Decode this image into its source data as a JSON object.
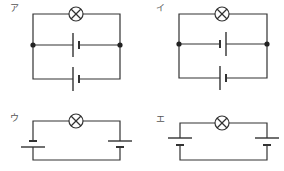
{
  "diagram": {
    "type": "circuit-choices",
    "colors": {
      "line": "#333333",
      "label": "#555555",
      "background": "#ffffff"
    },
    "circuits": [
      {
        "id": "a",
        "label": "ア",
        "description": "Lamp in series with two batteries connected in parallel; same orientation",
        "components": [
          "lamp",
          "battery",
          "battery"
        ],
        "battery_arrangement": "parallel",
        "junction_dots": 2
      },
      {
        "id": "b",
        "label": "イ",
        "description": "Lamp with two batteries in parallel; opposite orientations",
        "components": [
          "lamp",
          "battery",
          "battery"
        ],
        "battery_arrangement": "parallel-opposed",
        "junction_dots": 2
      },
      {
        "id": "c",
        "label": "ウ",
        "description": "Lamp with two batteries in series on left and right sides",
        "components": [
          "lamp",
          "battery",
          "battery"
        ],
        "battery_arrangement": "series",
        "junction_dots": 0
      },
      {
        "id": "d",
        "label": "エ",
        "description": "Lamp with two batteries on left and right sides, both same orientation (opposed in loop)",
        "components": [
          "lamp",
          "battery",
          "battery"
        ],
        "battery_arrangement": "series-opposed",
        "junction_dots": 0
      }
    ]
  }
}
